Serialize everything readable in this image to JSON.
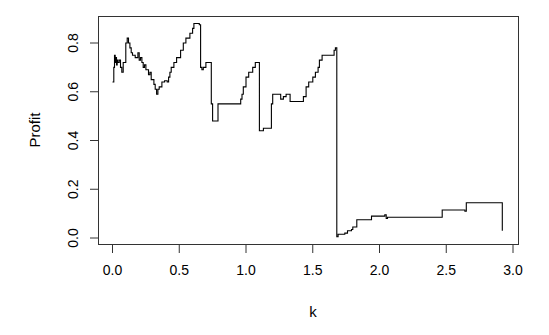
{
  "chart_data": {
    "type": "line",
    "title": "",
    "xlabel": "k",
    "ylabel": "Profit",
    "xlim": [
      -0.1,
      3.05
    ],
    "ylim": [
      -0.03,
      0.9
    ],
    "grid": false,
    "legend": null,
    "x_ticks": [
      0.0,
      0.5,
      1.0,
      1.5,
      2.0,
      2.5,
      3.0
    ],
    "x_tick_labels": [
      "0.0",
      "0.5",
      "1.0",
      "1.5",
      "2.0",
      "2.5",
      "3.0"
    ],
    "y_ticks": [
      0.0,
      0.2,
      0.4,
      0.6,
      0.8
    ],
    "y_tick_labels": [
      "0.0",
      "0.2",
      "0.4",
      "0.6",
      "0.8"
    ],
    "series": [
      {
        "name": "Profit",
        "color": "#000000",
        "step": true,
        "points": [
          [
            0.0,
            0.64
          ],
          [
            0.01,
            0.7
          ],
          [
            0.015,
            0.75
          ],
          [
            0.02,
            0.72
          ],
          [
            0.025,
            0.74
          ],
          [
            0.03,
            0.71
          ],
          [
            0.035,
            0.73
          ],
          [
            0.04,
            0.72
          ],
          [
            0.05,
            0.73
          ],
          [
            0.06,
            0.7
          ],
          [
            0.07,
            0.68
          ],
          [
            0.08,
            0.72
          ],
          [
            0.1,
            0.8
          ],
          [
            0.11,
            0.82
          ],
          [
            0.12,
            0.8
          ],
          [
            0.13,
            0.78
          ],
          [
            0.14,
            0.76
          ],
          [
            0.15,
            0.75
          ],
          [
            0.17,
            0.74
          ],
          [
            0.19,
            0.76
          ],
          [
            0.2,
            0.73
          ],
          [
            0.21,
            0.74
          ],
          [
            0.22,
            0.72
          ],
          [
            0.23,
            0.7
          ],
          [
            0.24,
            0.71
          ],
          [
            0.25,
            0.69
          ],
          [
            0.27,
            0.67
          ],
          [
            0.28,
            0.68
          ],
          [
            0.29,
            0.65
          ],
          [
            0.31,
            0.63
          ],
          [
            0.32,
            0.61
          ],
          [
            0.33,
            0.59
          ],
          [
            0.34,
            0.61
          ],
          [
            0.35,
            0.62
          ],
          [
            0.37,
            0.64
          ],
          [
            0.39,
            0.645
          ],
          [
            0.41,
            0.64
          ],
          [
            0.42,
            0.66
          ],
          [
            0.43,
            0.68
          ],
          [
            0.44,
            0.7
          ],
          [
            0.46,
            0.72
          ],
          [
            0.48,
            0.74
          ],
          [
            0.51,
            0.77
          ],
          [
            0.53,
            0.8
          ],
          [
            0.55,
            0.82
          ],
          [
            0.58,
            0.84
          ],
          [
            0.6,
            0.86
          ],
          [
            0.61,
            0.88
          ],
          [
            0.65,
            0.875
          ],
          [
            0.66,
            0.7
          ],
          [
            0.67,
            0.69
          ],
          [
            0.68,
            0.7
          ],
          [
            0.7,
            0.72
          ],
          [
            0.73,
            0.72
          ],
          [
            0.74,
            0.55
          ],
          [
            0.75,
            0.48
          ],
          [
            0.78,
            0.48
          ],
          [
            0.79,
            0.55
          ],
          [
            0.94,
            0.55
          ],
          [
            0.96,
            0.57
          ],
          [
            0.97,
            0.59
          ],
          [
            0.98,
            0.62
          ],
          [
            1.0,
            0.66
          ],
          [
            1.02,
            0.68
          ],
          [
            1.05,
            0.7
          ],
          [
            1.07,
            0.72
          ],
          [
            1.1,
            0.44
          ],
          [
            1.13,
            0.45
          ],
          [
            1.18,
            0.45
          ],
          [
            1.19,
            0.55
          ],
          [
            1.2,
            0.59
          ],
          [
            1.25,
            0.59
          ],
          [
            1.26,
            0.57
          ],
          [
            1.28,
            0.58
          ],
          [
            1.3,
            0.59
          ],
          [
            1.33,
            0.56
          ],
          [
            1.41,
            0.56
          ],
          [
            1.43,
            0.58
          ],
          [
            1.45,
            0.62
          ],
          [
            1.47,
            0.64
          ],
          [
            1.5,
            0.66
          ],
          [
            1.52,
            0.68
          ],
          [
            1.54,
            0.7
          ],
          [
            1.55,
            0.73
          ],
          [
            1.57,
            0.75
          ],
          [
            1.65,
            0.75
          ],
          [
            1.66,
            0.77
          ],
          [
            1.67,
            0.78
          ],
          [
            1.68,
            0.73
          ],
          [
            1.68,
            0.005
          ],
          [
            1.69,
            0.015
          ],
          [
            1.74,
            0.02
          ],
          [
            1.76,
            0.03
          ],
          [
            1.79,
            0.035
          ],
          [
            1.8,
            0.045
          ],
          [
            1.83,
            0.075
          ],
          [
            1.93,
            0.075
          ],
          [
            1.94,
            0.09
          ],
          [
            2.03,
            0.09
          ],
          [
            2.04,
            0.095
          ],
          [
            2.05,
            0.08
          ],
          [
            2.06,
            0.085
          ],
          [
            2.46,
            0.085
          ],
          [
            2.47,
            0.115
          ],
          [
            2.63,
            0.115
          ],
          [
            2.64,
            0.11
          ],
          [
            2.65,
            0.145
          ],
          [
            2.92,
            0.145
          ],
          [
            2.92,
            0.03
          ]
        ]
      }
    ]
  }
}
